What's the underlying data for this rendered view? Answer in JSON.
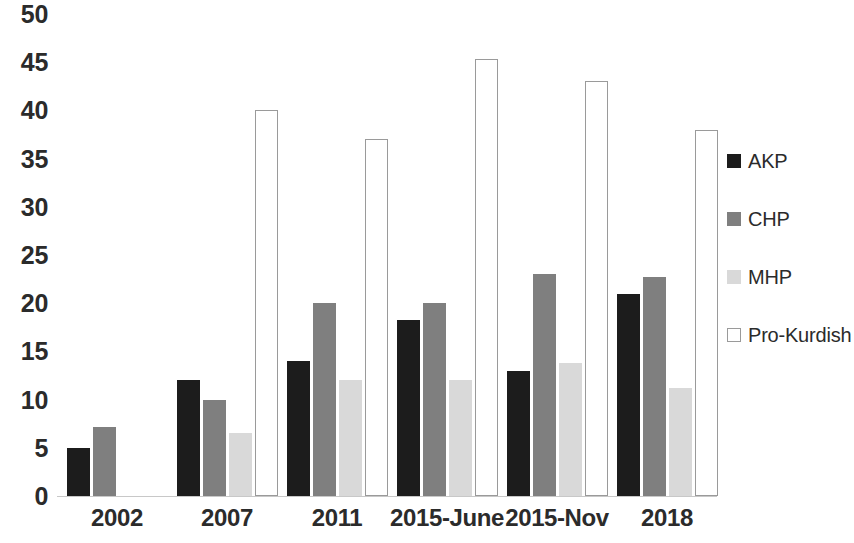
{
  "chart_data": {
    "type": "bar",
    "title": "",
    "subtitle": "",
    "xlabel": "",
    "ylabel": "",
    "categories": [
      "2002",
      "2007",
      "2011",
      "2015-June",
      "2015-Nov",
      "2018"
    ],
    "series": [
      {
        "name": "AKP",
        "color": "#1c1c1c",
        "values": [
          5,
          12,
          14,
          18.3,
          13,
          21
        ]
      },
      {
        "name": "CHP",
        "color": "#7f7f7f",
        "values": [
          7.2,
          10,
          20,
          20,
          23,
          22.7
        ]
      },
      {
        "name": "MHP",
        "color": "#d9d9d9",
        "values": [
          null,
          6.5,
          12,
          12,
          13.8,
          11.2
        ]
      },
      {
        "name": "Pro-Kurdish",
        "color": "#ffffff",
        "values": [
          null,
          40,
          37,
          45.3,
          43,
          38
        ]
      }
    ],
    "ylim": [
      0,
      50
    ],
    "y_ticks": [
      "0",
      "5",
      "10",
      "15",
      "20",
      "25",
      "30",
      "35",
      "40",
      "45",
      "50"
    ],
    "grid": false,
    "legend_position": "right",
    "background_color": "#ffffff",
    "axis_color": "#c8c8c8"
  }
}
